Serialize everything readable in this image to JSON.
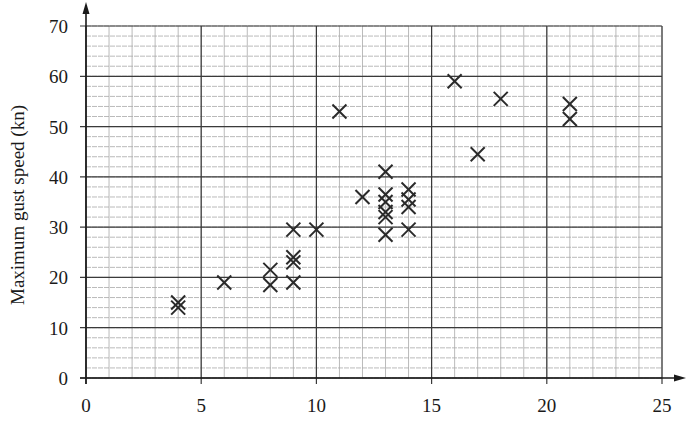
{
  "chart_data": {
    "type": "scatter",
    "title": "",
    "xlabel": "",
    "ylabel": "Maximum gust speed (kn)",
    "xlim": [
      0,
      25
    ],
    "ylim": [
      0,
      70
    ],
    "x_ticks": [
      0,
      5,
      10,
      15,
      20,
      25
    ],
    "y_ticks": [
      0,
      10,
      20,
      30,
      40,
      50,
      60,
      70
    ],
    "x_minor_step": 1,
    "y_minor_step": 2,
    "grid": true,
    "legend": null,
    "marker": "x",
    "points": [
      {
        "x": 4,
        "y": 14
      },
      {
        "x": 4,
        "y": 15
      },
      {
        "x": 6,
        "y": 19
      },
      {
        "x": 8,
        "y": 18.5
      },
      {
        "x": 8,
        "y": 21.5
      },
      {
        "x": 9,
        "y": 19
      },
      {
        "x": 9,
        "y": 23
      },
      {
        "x": 9,
        "y": 24
      },
      {
        "x": 9,
        "y": 29.5
      },
      {
        "x": 10,
        "y": 29.5
      },
      {
        "x": 11,
        "y": 53
      },
      {
        "x": 12,
        "y": 36
      },
      {
        "x": 13,
        "y": 28.5
      },
      {
        "x": 13,
        "y": 32
      },
      {
        "x": 13,
        "y": 33
      },
      {
        "x": 13,
        "y": 35
      },
      {
        "x": 13,
        "y": 36.5
      },
      {
        "x": 13,
        "y": 41
      },
      {
        "x": 14,
        "y": 29.5
      },
      {
        "x": 14,
        "y": 34
      },
      {
        "x": 14,
        "y": 35.5
      },
      {
        "x": 14,
        "y": 37.5
      },
      {
        "x": 16,
        "y": 59
      },
      {
        "x": 17,
        "y": 44.5
      },
      {
        "x": 18,
        "y": 55.5
      },
      {
        "x": 21,
        "y": 51.5
      },
      {
        "x": 21,
        "y": 54.5
      }
    ]
  },
  "colors": {
    "background": "#ffffff",
    "major_grid": "#3a3a3a",
    "minor_grid": "#a8a8a8",
    "axis": "#1a1a1a",
    "marker": "#2a2a2a"
  }
}
